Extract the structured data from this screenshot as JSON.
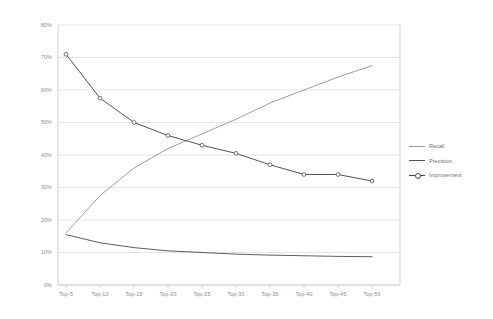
{
  "chart_data": {
    "type": "line",
    "title": "",
    "xlabel": "",
    "ylabel": "",
    "categories": [
      "Top-5",
      "Top-10",
      "Top-15",
      "Top-20",
      "Top-25",
      "Top-30",
      "Top-35",
      "Top-40",
      "Top-45",
      "Top-50"
    ],
    "ylim": [
      0,
      80
    ],
    "ytick_labels": [
      "0%",
      "10%",
      "20%",
      "30%",
      "40%",
      "50%",
      "60%",
      "70%",
      "80%"
    ],
    "ytick_values": [
      0,
      10,
      20,
      30,
      40,
      50,
      60,
      70,
      80
    ],
    "grid": true,
    "grid_axis": "y",
    "legend_position": "right",
    "series": [
      {
        "name": "Recall",
        "color": "#9a9a9a",
        "marker": "none",
        "values": [
          16.0,
          27.5,
          36.0,
          42.0,
          46.5,
          51.0,
          56.0,
          60.0,
          64.0,
          67.5
        ]
      },
      {
        "name": "Precision",
        "color": "#555555",
        "marker": "none",
        "values": [
          15.5,
          13.0,
          11.5,
          10.5,
          10.0,
          9.5,
          9.2,
          9.0,
          8.8,
          8.7
        ]
      },
      {
        "name": "Improvement",
        "color": "#4a4a4a",
        "marker": "circle",
        "values": [
          71.0,
          57.5,
          50.0,
          46.0,
          43.0,
          40.5,
          37.0,
          34.0,
          34.0,
          32.0
        ]
      }
    ]
  },
  "legend": {
    "items": [
      {
        "label": "Recall"
      },
      {
        "label": "Precision"
      },
      {
        "label": "Improvement"
      }
    ]
  },
  "colors": {
    "grid": "#d9d9d9",
    "axis": "#c4c4c4",
    "tick_text": "#8a8a8a",
    "legend_text": "#6f6f6f",
    "background": "#ffffff"
  }
}
